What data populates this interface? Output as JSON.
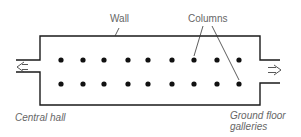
{
  "diagram": {
    "type": "floor-plan",
    "labels": {
      "wall": "Wall",
      "columns": "Columns",
      "central_hall": "Central hall",
      "ground_floor_line1": "Ground floor",
      "ground_floor_line2": "galleries"
    },
    "columns": {
      "rows": 2,
      "per_row": 9,
      "row_y": [
        60,
        84
      ],
      "col_x": [
        61,
        83,
        104,
        128,
        148,
        172,
        194,
        217,
        239
      ]
    },
    "arrows": [
      {
        "name": "entry-arrow-left",
        "direction": "left"
      },
      {
        "name": "exit-arrow-right",
        "direction": "right"
      }
    ],
    "colors": {
      "line": "#1a1a1a",
      "label": "#666666",
      "column": "#111111"
    }
  }
}
